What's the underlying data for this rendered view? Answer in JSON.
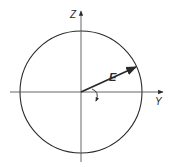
{
  "diagram": {
    "type": "polarization-circle",
    "colors": {
      "stroke": "#2a2a2a",
      "axis": "#555555",
      "background": "#ffffff"
    },
    "center": {
      "x": 81,
      "y": 92
    },
    "circle_radius": 61,
    "axes": {
      "vertical": {
        "label": "Z"
      },
      "horizontal": {
        "label": "Y"
      }
    },
    "vector": {
      "label": "E",
      "tip": {
        "x": 136,
        "y": 67
      }
    },
    "rotation_indicator": {
      "direction": "clockwise"
    }
  }
}
